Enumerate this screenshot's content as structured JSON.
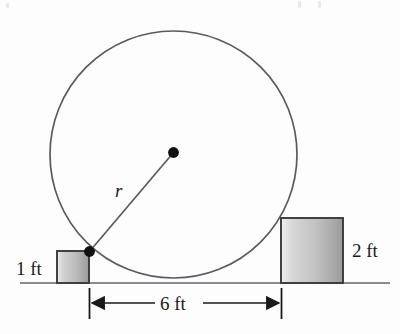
{
  "figure": {
    "name": "circle-tangent-to-blocks-diagram",
    "background_color": "#fdfdfd"
  },
  "labels": {
    "left_block_height": "1 ft",
    "right_block_height": "2 ft",
    "span_between_blocks": "6 ft",
    "radius": "r"
  },
  "colors": {
    "outline": "#4a4a4f",
    "block_outline": "#3a3a3a",
    "block_fill_light": "#f2f2f2",
    "block_fill_dark": "#9b9b9b",
    "ground": "#8a8a90",
    "dot": "#111111",
    "dimension": "#1a1a1a",
    "text": "#1a1a1a"
  },
  "geometry": {
    "circle": {
      "cx": 173.5,
      "cy": 154.5,
      "r": 123.5
    },
    "center_dot": {
      "cx": 173.5,
      "cy": 152.5,
      "r": 5.2
    },
    "tangent_dot": {
      "cx": 89.5,
      "cy": 251.5,
      "r": 5.2
    },
    "radius_line": {
      "x1": 89.5,
      "y1": 251.5,
      "x2": 173.5,
      "y2": 152.5
    },
    "ground_line": {
      "x1": 20,
      "y1": 283,
      "x2": 390,
      "y2": 283
    },
    "left_block": {
      "x": 57,
      "y": 251,
      "width": 32,
      "height": 32
    },
    "right_block": {
      "x": 281,
      "y": 218,
      "width": 62,
      "height": 65
    },
    "dimension_line": {
      "x1": 89.5,
      "x2": 281.5,
      "y": 303
    },
    "extension_ticks": {
      "top": 288,
      "bottom": 319
    }
  },
  "label_positions": {
    "left_block_height": {
      "x": 16,
      "y": 275
    },
    "right_block_height": {
      "x": 352,
      "y": 257
    },
    "span_between_blocks": {
      "x": 160,
      "y": 310
    },
    "radius": {
      "x": 115,
      "y": 197
    }
  }
}
